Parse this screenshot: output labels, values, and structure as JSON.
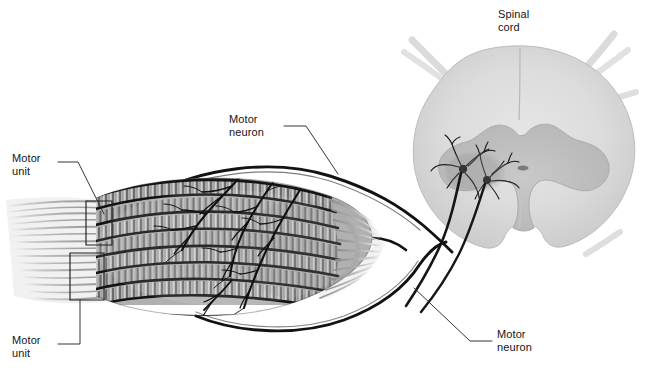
{
  "figure": {
    "background_color": "#ffffff",
    "ink_color": "#141414",
    "tissue_light": "#d8d8d8",
    "tissue_mid": "#c2c2c2",
    "tissue_dark": "#a9a9a9",
    "muscle_tone": "#8f8f8f"
  },
  "labels": {
    "spinal_cord": "Spinal\ncord",
    "motor_neuron_top": "Motor\nneuron",
    "motor_neuron_bottom": "Motor\nneuron",
    "motor_unit_top": "Motor\nunit",
    "motor_unit_bottom": "Motor\nunit"
  },
  "structures": {
    "muscle": "fusiform skeletal muscle with striated fascicles and tapering tendons",
    "spinal_cord": "transverse section with butterfly-shaped gray matter and central canal",
    "motor_neurons": "two ventral horn somas with dendritic arbors and axons",
    "nerve_trunk": "peripheral nerve arcing from muscle to ventral root",
    "motor_unit_brackets": "two rectangular brackets on left tendon region"
  },
  "counts": {
    "muscle_fascicles": 8,
    "motor_neuron_somas": 2,
    "motor_unit_brackets": 2,
    "label_count": 5
  }
}
